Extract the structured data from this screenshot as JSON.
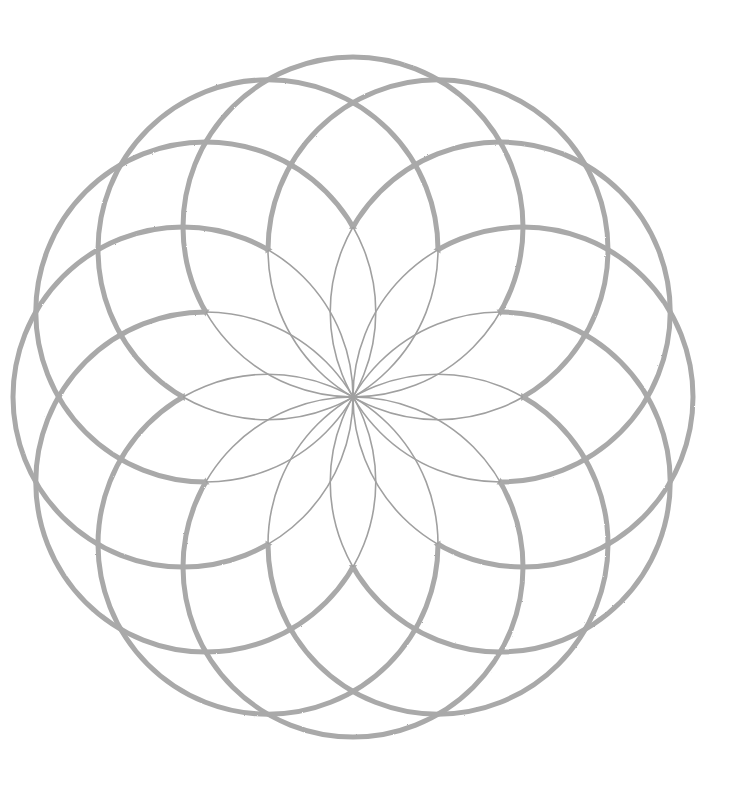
{
  "artwork": {
    "title": "Circle rosette drawing",
    "circle_count": 12,
    "center": [
      353,
      397
    ],
    "circle_radius": 170,
    "rotation_deg": 0,
    "stroke_color": "#a9a9a9",
    "inner_stroke_color": "#a0a0a0",
    "inner_stroke_width": 1.6,
    "outer_stroke_width": 5,
    "background": "#ffffff"
  }
}
